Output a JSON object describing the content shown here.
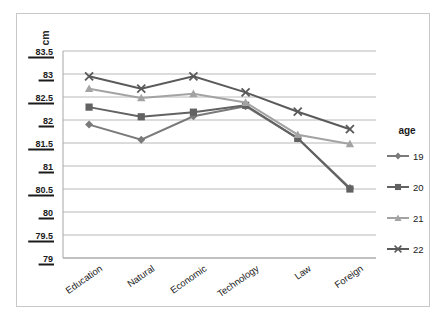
{
  "chart_data": {
    "type": "line",
    "title": "",
    "xlabel": "",
    "ylabel": "cm",
    "ylim": [
      79,
      83.5
    ],
    "ytick_step": 0.5,
    "grid": true,
    "legend_position": "right",
    "legend_title": "age",
    "categories": [
      "Education",
      "Natural",
      "Economic",
      "Technology",
      "Law",
      "Foreign"
    ],
    "yticks": [
      "79",
      "79.5",
      "80",
      "80.5",
      "81",
      "81.5",
      "82",
      "82.5",
      "83",
      "83.5"
    ],
    "series": [
      {
        "name": "19",
        "marker": "diamond",
        "color": "#7a7a7a",
        "values": [
          81.9,
          81.57,
          82.08,
          82.3,
          81.6,
          80.52
        ]
      },
      {
        "name": "20",
        "marker": "square",
        "color": "#626262",
        "values": [
          82.28,
          82.07,
          82.17,
          82.32,
          81.6,
          80.5
        ]
      },
      {
        "name": "21",
        "marker": "triangle",
        "color": "#a3a3a3",
        "values": [
          82.68,
          82.48,
          82.57,
          82.38,
          81.68,
          81.48
        ]
      },
      {
        "name": "22",
        "marker": "cross",
        "color": "#5a5a5a",
        "values": [
          82.95,
          82.68,
          82.95,
          82.6,
          82.18,
          81.8
        ]
      }
    ]
  }
}
